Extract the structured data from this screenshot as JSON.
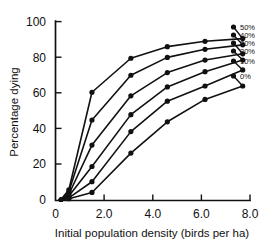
{
  "chart_data": {
    "type": "line",
    "title": "",
    "xlabel": "Initial population density (birds per ha)",
    "ylabel": "Percentage dying",
    "xlim": [
      0,
      8.0
    ],
    "ylim": [
      0,
      100
    ],
    "xticks": [
      "0",
      "2.0",
      "4.0",
      "6.0",
      "8.0"
    ],
    "xtick_values": [
      0,
      2.0,
      4.0,
      6.0,
      8.0
    ],
    "yticks": [
      "0",
      "20",
      "40",
      "60",
      "80",
      "100"
    ],
    "ytick_values": [
      0,
      20,
      40,
      60,
      80,
      100
    ],
    "grid": false,
    "legend_position": "right-outside",
    "x": [
      0.55,
      1.5,
      3.1,
      4.6,
      6.15,
      7.7
    ],
    "series": [
      {
        "name": "50%",
        "values": [
          6,
          60.5,
          79.5,
          86,
          89,
          90.5
        ]
      },
      {
        "name": "40%",
        "values": [
          5,
          45,
          70,
          80,
          84.5,
          87
        ]
      },
      {
        "name": "30%",
        "values": [
          3.5,
          31,
          58.5,
          71.5,
          78.5,
          82
        ]
      },
      {
        "name": "20%",
        "values": [
          2.5,
          19,
          48,
          63.5,
          72,
          78.5
        ]
      },
      {
        "name": "10%",
        "values": [
          1.5,
          10.5,
          38.5,
          55.5,
          64,
          73
        ]
      },
      {
        "name": "0%",
        "values": [
          1,
          4.5,
          26.5,
          44,
          56.5,
          64
        ]
      }
    ]
  },
  "legend": {
    "items": [
      {
        "label": "50%"
      },
      {
        "label": "40%"
      },
      {
        "label": "30%"
      },
      {
        "label": "20%"
      },
      {
        "label": "10%"
      },
      {
        "label": "0%"
      }
    ]
  }
}
